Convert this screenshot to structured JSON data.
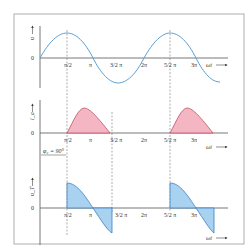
{
  "colors": {
    "frame": "#888888",
    "curve": "#5a9fd4",
    "pink_fill": "#f4b6c2",
    "pink_stroke": "#c0506a",
    "blue_fill": "#a9d2f0",
    "blue_stroke": "#3a7fc0",
    "axis": "#555555"
  },
  "panels": [
    {
      "id": "voltage",
      "ylabel": "u",
      "origin": "0",
      "xlabel": "ωt"
    },
    {
      "id": "current",
      "ylabel": "i_a",
      "origin": "0",
      "xlabel": "ωt"
    },
    {
      "id": "thyristor-voltage",
      "ylabel": "u_T",
      "origin": "0",
      "xlabel": "ωt"
    }
  ],
  "ticks": {
    "half_pi": "π/2",
    "pi": "π",
    "three_half_pi": "3/2 π",
    "two_pi": "2π",
    "five_half_pi": "5/2 π",
    "three_pi": "3π"
  },
  "annotation": {
    "phase_angle": "φ₂ = 90°"
  }
}
